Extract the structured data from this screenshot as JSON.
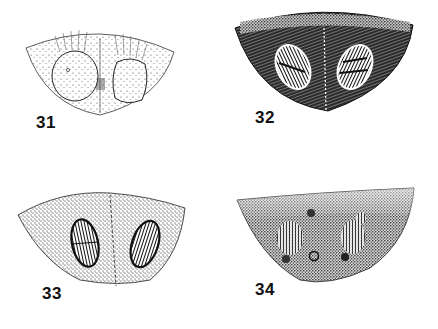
{
  "plate": {
    "background": "#ffffff",
    "ink": "#111111"
  },
  "figures": [
    {
      "number": "31",
      "style": "light stippling, rounded pale plates, radiating fine lines"
    },
    {
      "number": "32",
      "style": "dense dark hatching, two striated oval plates"
    },
    {
      "number": "33",
      "style": "medium stippling, two dark-rimmed striated ovals, median line"
    },
    {
      "number": "34",
      "style": "heavy stippling darkening toward apex, faint striated areas, small pits"
    }
  ]
}
